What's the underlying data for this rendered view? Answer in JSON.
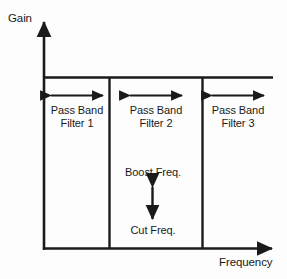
{
  "diagram": {
    "axes": {
      "y_label": "Gain",
      "x_label": "Frequency"
    },
    "bands": [
      {
        "line1": "Pass Band",
        "line2": "Filter 1",
        "arrow_name": "band-1-width-arrow"
      },
      {
        "line1": "Pass Band",
        "line2": "Filter 2",
        "arrow_name": "band-2-width-arrow"
      },
      {
        "line1": "Pass Band",
        "line2": "Filter 3",
        "arrow_name": "band-3-width-arrow"
      }
    ],
    "gain_range": {
      "top_label": "Boost Freq.",
      "bottom_label": "Cut Freq."
    },
    "colors": {
      "stroke": "#1a1a1a",
      "background": "#fdfdfd",
      "text": "#1a1a1a"
    }
  }
}
